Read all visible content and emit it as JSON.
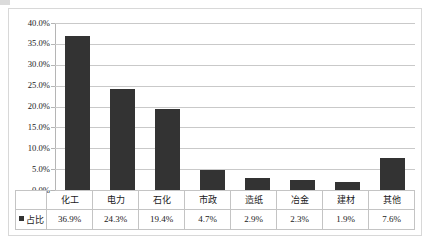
{
  "chart_data": {
    "type": "bar",
    "title": "",
    "subtitle": "",
    "xlabel": "",
    "ylabel": "",
    "categories": [
      "化工",
      "电力",
      "石化",
      "市政",
      "造纸",
      "冶金",
      "建材",
      "其他"
    ],
    "values": [
      36.9,
      24.3,
      19.4,
      4.7,
      2.9,
      2.3,
      1.9,
      7.6
    ],
    "value_labels": [
      "36.9%",
      "24.3%",
      "19.4%",
      "4.7%",
      "2.9%",
      "2.3%",
      "1.9%",
      "7.6%"
    ],
    "series": [
      {
        "name": "占比",
        "values": [
          36.9,
          24.3,
          19.4,
          4.7,
          2.9,
          2.3,
          1.9,
          7.6
        ],
        "color": "#333333"
      }
    ],
    "ylim": [
      0,
      40
    ],
    "ytick_step": 5,
    "ytick_labels": [
      "0.0%",
      "5.0%",
      "10.0%",
      "15.0%",
      "20.0%",
      "25.0%",
      "30.0%",
      "35.0%",
      "40.0%"
    ],
    "grid": true,
    "legend_position": "table-left",
    "data_table_visible": true
  },
  "legend": {
    "series_label": "占比",
    "marker": "square-marker",
    "marker_color": "#333333"
  },
  "colors": {
    "bar": "#333333",
    "gridline": "#c9c9c9",
    "axis": "#b5b5b5",
    "table_border": "#c4c4c4",
    "frame": "#d8d8d8",
    "background": "#ffffff",
    "text": "#1a1a1a"
  }
}
